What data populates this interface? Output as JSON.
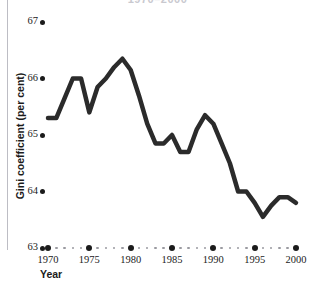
{
  "chart_data": {
    "type": "line",
    "title": "1970–2000",
    "xlabel": "Year",
    "ylabel": "Gini coefficient (per cent)",
    "xlim": [
      1970,
      2000
    ],
    "ylim": [
      63,
      67
    ],
    "yticks": [
      63,
      64,
      65,
      66,
      67
    ],
    "ytick_labels": [
      "63",
      "64",
      "65",
      "66",
      "67"
    ],
    "xticks": [
      1970,
      1975,
      1980,
      1985,
      1990,
      1995,
      2000
    ],
    "xtick_labels": [
      "1970",
      "1975",
      "1980",
      "1985",
      "1990",
      "1995",
      "2000"
    ],
    "xminor_step": 1,
    "grid": false,
    "legend": "none",
    "line_color": "#2b2b2b",
    "line_width": 4.5,
    "series": [
      {
        "name": "Gini coefficient (per cent)",
        "x": [
          1970,
          1971,
          1972,
          1973,
          1974,
          1975,
          1976,
          1977,
          1978,
          1979,
          1980,
          1981,
          1982,
          1983,
          1984,
          1985,
          1986,
          1987,
          1988,
          1989,
          1990,
          1991,
          1992,
          1993,
          1994,
          1995,
          1996,
          1997,
          1998,
          1999,
          2000
        ],
        "y": [
          65.3,
          65.3,
          65.65,
          66.0,
          66.0,
          65.4,
          65.85,
          66.0,
          66.2,
          66.35,
          66.15,
          65.7,
          65.2,
          64.85,
          64.85,
          65.0,
          64.7,
          64.7,
          65.1,
          65.35,
          65.2,
          64.85,
          64.5,
          64.0,
          64.0,
          63.8,
          63.55,
          63.75,
          63.9,
          63.9,
          63.8
        ]
      }
    ]
  },
  "axis": {
    "y_title": "Gini coefficient (per cent)",
    "x_title": "Year"
  }
}
